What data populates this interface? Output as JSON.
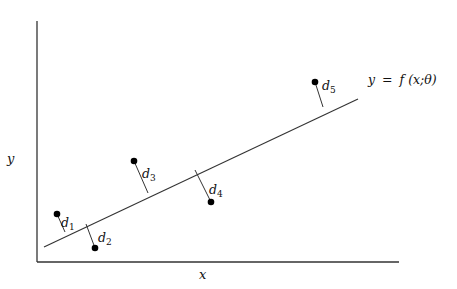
{
  "diagram": {
    "axes": {
      "x_label": "x",
      "y_label": "y",
      "origin": [
        37,
        262
      ],
      "x_end": [
        399,
        262
      ],
      "y_end": [
        37,
        21
      ]
    },
    "fit_line": {
      "label_lhs": "y",
      "label_eq": "=",
      "label_rhs_f": "f",
      "label_rhs_args": "(x;θ)",
      "start": [
        44,
        247
      ],
      "end": [
        358,
        99
      ]
    },
    "points": [
      {
        "name": "d1",
        "label": "d",
        "sub": "1",
        "point": [
          57,
          214
        ],
        "foot": [
          65,
          232
        ],
        "label_pos": [
          60,
          228
        ]
      },
      {
        "name": "d2",
        "label": "d",
        "sub": "2",
        "point": [
          95,
          248
        ],
        "foot": [
          86,
          222
        ],
        "label_pos": [
          98,
          242
        ]
      },
      {
        "name": "d3",
        "label": "d",
        "sub": "3",
        "point": [
          134,
          161
        ],
        "foot": [
          148,
          193
        ],
        "label_pos": [
          143,
          178
        ]
      },
      {
        "name": "d4",
        "label": "d",
        "sub": "4",
        "point": [
          211,
          202
        ],
        "foot": [
          196,
          170
        ],
        "label_pos": [
          210,
          194
        ]
      },
      {
        "name": "d5",
        "label": "d",
        "sub": "5",
        "point": [
          315,
          82
        ],
        "foot": [
          322,
          107
        ],
        "label_pos": [
          323,
          94
        ]
      }
    ]
  },
  "colors": {
    "stroke": "#222222",
    "point": "#000000",
    "background": "#ffffff"
  }
}
